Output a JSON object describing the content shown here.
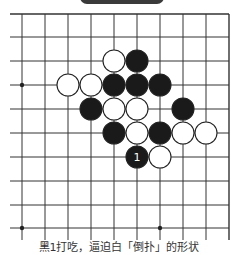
{
  "header": {
    "tab_color": "#3a3a3a"
  },
  "board": {
    "columns_x": [
      22,
      45,
      68,
      91,
      114,
      137,
      160,
      183,
      206,
      229
    ],
    "rows_y": [
      14,
      37,
      61,
      85,
      109,
      133,
      157,
      181,
      205,
      228
    ],
    "line_extent": {
      "left": 10,
      "right": 229,
      "top": 14,
      "bottom": 240
    },
    "line_color": "#333333",
    "star_points": [
      [
        0,
        3
      ],
      [
        0,
        9
      ],
      [
        6,
        9
      ]
    ],
    "stone_radius": 11,
    "stones": [
      {
        "col": 4,
        "row": 2,
        "color": "white"
      },
      {
        "col": 5,
        "row": 2,
        "color": "black"
      },
      {
        "col": 2,
        "row": 3,
        "color": "white"
      },
      {
        "col": 3,
        "row": 3,
        "color": "white"
      },
      {
        "col": 4,
        "row": 3,
        "color": "black"
      },
      {
        "col": 5,
        "row": 3,
        "color": "black"
      },
      {
        "col": 6,
        "row": 3,
        "color": "black"
      },
      {
        "col": 3,
        "row": 4,
        "color": "black"
      },
      {
        "col": 4,
        "row": 4,
        "color": "white"
      },
      {
        "col": 5,
        "row": 4,
        "color": "white"
      },
      {
        "col": 7,
        "row": 4,
        "color": "black"
      },
      {
        "col": 4,
        "row": 5,
        "color": "black"
      },
      {
        "col": 5,
        "row": 5,
        "color": "white"
      },
      {
        "col": 6,
        "row": 5,
        "color": "black"
      },
      {
        "col": 7,
        "row": 5,
        "color": "white"
      },
      {
        "col": 8,
        "row": 5,
        "color": "white"
      },
      {
        "col": 5,
        "row": 6,
        "color": "black",
        "label": "1"
      },
      {
        "col": 6,
        "row": 6,
        "color": "white"
      }
    ]
  },
  "caption": {
    "text": "黑1打吃，逼迫白「倒扑」的形状"
  }
}
